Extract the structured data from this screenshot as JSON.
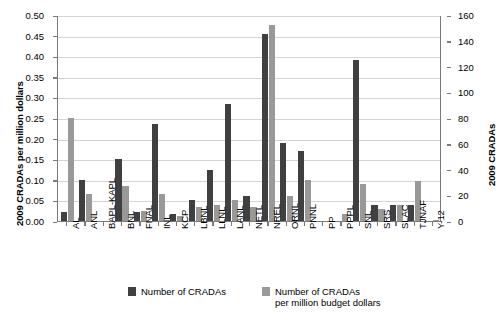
{
  "chart_data": {
    "type": "bar",
    "title": "",
    "xlabel": "",
    "ylabel": "2009 CRADAs per million dollars",
    "ylabel_right": "2009 CRADAs",
    "ylim": [
      0,
      0.5
    ],
    "ylim_right": [
      0,
      160
    ],
    "yticks": [
      "0.00",
      "0.05",
      "0.10",
      "0.15",
      "0.20",
      "0.25",
      "0.30",
      "0.35",
      "0.40",
      "0.45",
      "0.50"
    ],
    "ytick_values": [
      0,
      0.05,
      0.1,
      0.15,
      0.2,
      0.25,
      0.3,
      0.35,
      0.4,
      0.45,
      0.5
    ],
    "yticks_right": [
      "0",
      "20",
      "40",
      "60",
      "80",
      "100",
      "120",
      "140",
      "160"
    ],
    "ytick_values_right": [
      0,
      20,
      40,
      60,
      80,
      100,
      120,
      140,
      160
    ],
    "grid": true,
    "legend_position": "bottom",
    "categories": [
      "AL",
      "ANL",
      "BAPL-KAPL",
      "BNL",
      "FNAL",
      "INL",
      "KCP",
      "LBNL",
      "LLNL",
      "LANL",
      "NETL",
      "NREL",
      "ORNL",
      "PNNL",
      "PP",
      "PPPL",
      "SNL",
      "SRS",
      "SLAC",
      "TJNAF",
      "Y-12"
    ],
    "series": [
      {
        "name": "Number of CRADAs",
        "color": "#404040",
        "axis": "right",
        "values": [
          0.021,
          0.1,
          null,
          0.15,
          0.021,
          0.235,
          0.018,
          0.05,
          0.125,
          0.285,
          0.06,
          0.455,
          0.19,
          0.17,
          null,
          null,
          0.39,
          0.04,
          0.038,
          0.04,
          null
        ],
        "values_right_axis": [
          6.7,
          32,
          null,
          48,
          6.7,
          75,
          5.8,
          16,
          40,
          91,
          19,
          146,
          61,
          54,
          null,
          null,
          125,
          13,
          12,
          13,
          null
        ]
      },
      {
        "name": "Number of CRADAs per million budget dollars",
        "color": "#999999",
        "axis": "left",
        "values": [
          0.25,
          0.065,
          null,
          0.085,
          0.025,
          0.065,
          0.013,
          0.035,
          0.04,
          0.05,
          0.035,
          0.475,
          0.06,
          0.1,
          null,
          0.018,
          0.09,
          0.028,
          0.038,
          0.097,
          0.003
        ]
      }
    ],
    "legend": [
      {
        "label": "Number of CRADAs",
        "color": "#404040"
      },
      {
        "label": "Number of CRADAs\nper million budget dollars",
        "color": "#999999"
      }
    ]
  },
  "colors": {
    "dark_bar": "#404040",
    "light_bar": "#999999",
    "grid": "#d4d4d4",
    "axis": "#7a7a7a",
    "background": "#ffffff"
  }
}
